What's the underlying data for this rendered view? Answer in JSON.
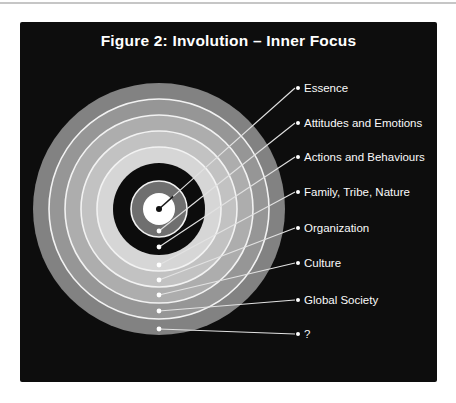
{
  "figure": {
    "title": "Figure 2: Involution – Inner Focus"
  },
  "diagram": {
    "page_background": "#ffffff",
    "divider_color": "#c6c6c6",
    "panel_background": "#0d0d0d",
    "separator_color": "#f2f2f2",
    "leader_line_color": "#e2e2e2",
    "label_color": "#fafafa",
    "center": {
      "x": 139,
      "y": 187
    },
    "label_dot_x": 278,
    "separator_radii": [
      28,
      62,
      78,
      94,
      110
    ],
    "layers": [
      {
        "label": "Essence",
        "radius": 16,
        "color": "#ffffff",
        "dot": {
          "x": 139,
          "y": 187
        },
        "dot_color": "#101010",
        "label_y": 66
      },
      {
        "label": "Attitudes and Emotions",
        "radius": 28,
        "color": "#6f6f6f",
        "dot": {
          "x": 139,
          "y": 209
        },
        "dot_color": "#ffffff",
        "label_y": 101
      },
      {
        "label": "Actions and Behaviours",
        "radius": 46,
        "color": "#0c0c0c",
        "dot": {
          "x": 139,
          "y": 225
        },
        "dot_color": "#ffffff",
        "label_y": 135
      },
      {
        "label": "Family, Tribe, Nature",
        "radius": 62,
        "color": "#d6d6d6",
        "dot": {
          "x": 139,
          "y": 243
        },
        "dot_color": "#ffffff",
        "label_y": 170
      },
      {
        "label": "Organization",
        "radius": 78,
        "color": "#c2c2c2",
        "dot": {
          "x": 139,
          "y": 258
        },
        "dot_color": "#ffffff",
        "label_y": 206
      },
      {
        "label": "Culture",
        "radius": 94,
        "color": "#adadad",
        "dot": {
          "x": 139,
          "y": 273
        },
        "dot_color": "#ffffff",
        "label_y": 241
      },
      {
        "label": "Global Society",
        "radius": 110,
        "color": "#969696",
        "dot": {
          "x": 139,
          "y": 289
        },
        "dot_color": "#ffffff",
        "label_y": 278
      },
      {
        "label": "?",
        "radius": 126,
        "color": "#828282",
        "dot": {
          "x": 139,
          "y": 307
        },
        "dot_color": "#ffffff",
        "label_y": 312
      }
    ]
  }
}
